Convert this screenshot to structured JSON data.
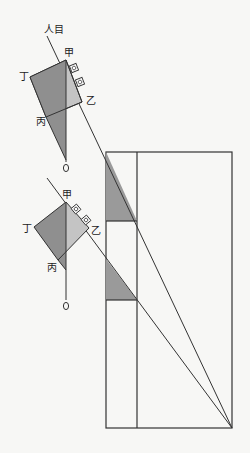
{
  "diagram": {
    "title": "",
    "colors": {
      "background": "#f7f7f5",
      "line": "#333333",
      "shade_dark": "#8f8f8f",
      "shade_light": "#c4c4c4"
    },
    "labels": {
      "eye": "人目",
      "upper": {
        "jia": "甲",
        "yi": "乙",
        "bing": "丙",
        "ding": "丁"
      },
      "lower": {
        "jia": "甲",
        "yi": "乙",
        "bing": "丙",
        "ding": "丁"
      }
    },
    "figures": [
      {
        "name": "upper-instrument",
        "points": {
          "jia": [
            66,
            60
          ],
          "yi": [
            82,
            102
          ],
          "bing": [
            46,
            117
          ],
          "ding": [
            30,
            77
          ]
        },
        "plumb_end": [
          66,
          162
        ]
      },
      {
        "name": "lower-instrument",
        "points": {
          "jia": [
            66,
            202
          ],
          "yi": [
            89,
            228
          ],
          "bing": [
            58,
            260
          ],
          "ding": [
            34,
            227
          ]
        },
        "plumb_end": [
          66,
          300
        ]
      }
    ],
    "rectangle": {
      "left": 106,
      "inner": 137,
      "right": 232,
      "top": 152,
      "bottom": 428,
      "divider_y": 221,
      "divider2_y": 300
    }
  }
}
